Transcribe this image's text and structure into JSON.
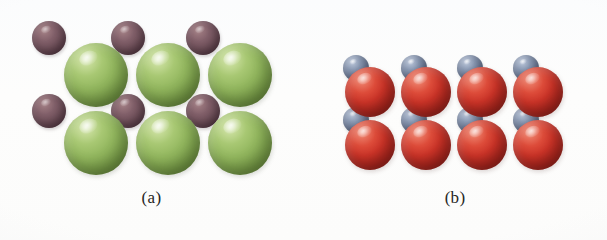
{
  "figure": {
    "background_color": "#fdfdfd",
    "width": 607,
    "height": 240
  },
  "panels": [
    {
      "id": "a",
      "caption": "(a)",
      "large_sphere": {
        "name": "large-green-sphere",
        "color": "#93b75f",
        "highlight_color": "#e5f0cd",
        "shadow_color": "#47612a",
        "diameter_px": 64,
        "count": 6,
        "rows": 2,
        "columns": 3
      },
      "small_sphere": {
        "name": "small-maroon-sphere",
        "color": "#74545e",
        "highlight_color": "#ab8a8e",
        "shadow_color": "#432f37",
        "diameter_px": 34,
        "count": 6,
        "rows": 2,
        "columns": 3
      },
      "large_positions": [
        {
          "cx": 96,
          "cy": 75,
          "r": 32
        },
        {
          "cx": 168,
          "cy": 75,
          "r": 32
        },
        {
          "cx": 240,
          "cy": 75,
          "r": 32
        },
        {
          "cx": 96,
          "cy": 143,
          "r": 32
        },
        {
          "cx": 168,
          "cy": 143,
          "r": 32
        },
        {
          "cx": 240,
          "cy": 143,
          "r": 32
        }
      ],
      "small_positions": [
        {
          "cx": 49,
          "cy": 38,
          "r": 17
        },
        {
          "cx": 128,
          "cy": 38,
          "r": 17
        },
        {
          "cx": 203,
          "cy": 38,
          "r": 17
        },
        {
          "cx": 49,
          "cy": 111,
          "r": 17
        },
        {
          "cx": 128,
          "cy": 111,
          "r": 17
        },
        {
          "cx": 203,
          "cy": 111,
          "r": 17
        }
      ]
    },
    {
      "id": "b",
      "caption": "(b)",
      "large_sphere": {
        "name": "large-red-sphere",
        "color": "#cf3529",
        "highlight_color": "#f3a694",
        "shadow_color": "#7a1d18",
        "diameter_px": 50,
        "count": 8,
        "rows": 2,
        "columns": 4
      },
      "small_sphere": {
        "name": "small-slate-sphere",
        "color": "#7a89a5",
        "highlight_color": "#ccd5e4",
        "shadow_color": "#414b5e",
        "diameter_px": 26,
        "count": 8,
        "rows": 2,
        "columns": 4
      },
      "large_positions": [
        {
          "cx": 67,
          "cy": 92,
          "r": 25
        },
        {
          "cx": 123,
          "cy": 92,
          "r": 25
        },
        {
          "cx": 179,
          "cy": 92,
          "r": 25
        },
        {
          "cx": 235,
          "cy": 92,
          "r": 25
        },
        {
          "cx": 67,
          "cy": 145,
          "r": 25
        },
        {
          "cx": 123,
          "cy": 145,
          "r": 25
        },
        {
          "cx": 179,
          "cy": 145,
          "r": 25
        },
        {
          "cx": 235,
          "cy": 145,
          "r": 25
        }
      ],
      "small_positions": [
        {
          "cx": 53,
          "cy": 68,
          "r": 13
        },
        {
          "cx": 111,
          "cy": 68,
          "r": 13
        },
        {
          "cx": 167,
          "cy": 68,
          "r": 13
        },
        {
          "cx": 223,
          "cy": 68,
          "r": 13
        },
        {
          "cx": 53,
          "cy": 120,
          "r": 13
        },
        {
          "cx": 111,
          "cy": 120,
          "r": 13
        },
        {
          "cx": 167,
          "cy": 120,
          "r": 13
        },
        {
          "cx": 223,
          "cy": 120,
          "r": 13
        }
      ]
    }
  ]
}
